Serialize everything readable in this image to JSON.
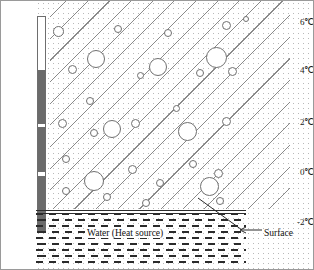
{
  "figure": {
    "width": 314,
    "height": 270
  },
  "colors": {
    "ink": "#2b2b2b",
    "hatch": "#8a8a8a",
    "stipple": "#b9b9b9",
    "mercury": "#6b6b6b",
    "bubble_fill": "#ffffff",
    "background": "#ffffff"
  },
  "scale": {
    "unit": "°C",
    "ticks": [
      {
        "label": "6℃",
        "value": 6,
        "y": 22
      },
      {
        "label": "4℃",
        "value": 4,
        "y": 70
      },
      {
        "label": "2℃",
        "value": 2,
        "y": 122
      },
      {
        "label": "0℃",
        "value": 0,
        "y": 172
      },
      {
        "label": "-2℃",
        "value": -2,
        "y": 222
      }
    ],
    "axis_min": -2,
    "axis_max": 6
  },
  "thermometer": {
    "name": "thermometer",
    "top": 16,
    "bottom": 233,
    "mercury_segments": [
      {
        "top": 70,
        "height": 54,
        "label": "4℃ to 2℃"
      },
      {
        "top": 127,
        "height": 45,
        "label": "2℃ to 0℃ upper"
      },
      {
        "top": 176,
        "height": 56,
        "label": "0℃ to -2℃"
      }
    ]
  },
  "ice": {
    "name": "ice-layer",
    "hatch_angle_deg": -45,
    "hatch_spacing_px": 15,
    "bubbles": [
      {
        "cx": 8,
        "cy": 30,
        "r": 5.5
      },
      {
        "cx": 68,
        "cy": 28,
        "r": 4.0
      },
      {
        "cx": 118,
        "cy": 32,
        "r": 4.0
      },
      {
        "cx": 176,
        "cy": 24,
        "r": 4.5
      },
      {
        "cx": 196,
        "cy": 18,
        "r": 3.0
      },
      {
        "cx": 46,
        "cy": 58,
        "r": 9.0
      },
      {
        "cx": 108,
        "cy": 66,
        "r": 9.0
      },
      {
        "cx": 166,
        "cy": 56,
        "r": 10.5
      },
      {
        "cx": 22,
        "cy": 68,
        "r": 4.5
      },
      {
        "cx": 90,
        "cy": 74,
        "r": 3.5
      },
      {
        "cx": 150,
        "cy": 72,
        "r": 4.0
      },
      {
        "cx": 182,
        "cy": 70,
        "r": 4.5
      },
      {
        "cx": 40,
        "cy": 100,
        "r": 4.0
      },
      {
        "cx": 126,
        "cy": 107,
        "r": 3.5
      },
      {
        "cx": 12,
        "cy": 122,
        "r": 4.5
      },
      {
        "cx": 62,
        "cy": 128,
        "r": 9.0
      },
      {
        "cx": 85,
        "cy": 122,
        "r": 4.5
      },
      {
        "cx": 44,
        "cy": 132,
        "r": 4.0
      },
      {
        "cx": 137,
        "cy": 130,
        "r": 9.5
      },
      {
        "cx": 176,
        "cy": 120,
        "r": 4.5
      },
      {
        "cx": 16,
        "cy": 158,
        "r": 4.0
      },
      {
        "cx": 82,
        "cy": 168,
        "r": 4.5
      },
      {
        "cx": 44,
        "cy": 180,
        "r": 10.0
      },
      {
        "cx": 143,
        "cy": 163,
        "r": 4.0
      },
      {
        "cx": 168,
        "cy": 172,
        "r": 4.5
      },
      {
        "cx": 110,
        "cy": 182,
        "r": 4.0
      },
      {
        "cx": 159,
        "cy": 185,
        "r": 9.5
      },
      {
        "cx": 16,
        "cy": 190,
        "r": 4.0
      },
      {
        "cx": 57,
        "cy": 196,
        "r": 4.0
      },
      {
        "cx": 96,
        "cy": 202,
        "r": 4.0
      },
      {
        "cx": 170,
        "cy": 200,
        "r": 4.0
      }
    ]
  },
  "water": {
    "name": "water-region",
    "label": "Water (Heat source)",
    "dash_rows": 9
  },
  "annotations": {
    "surface_label": "Surface"
  }
}
